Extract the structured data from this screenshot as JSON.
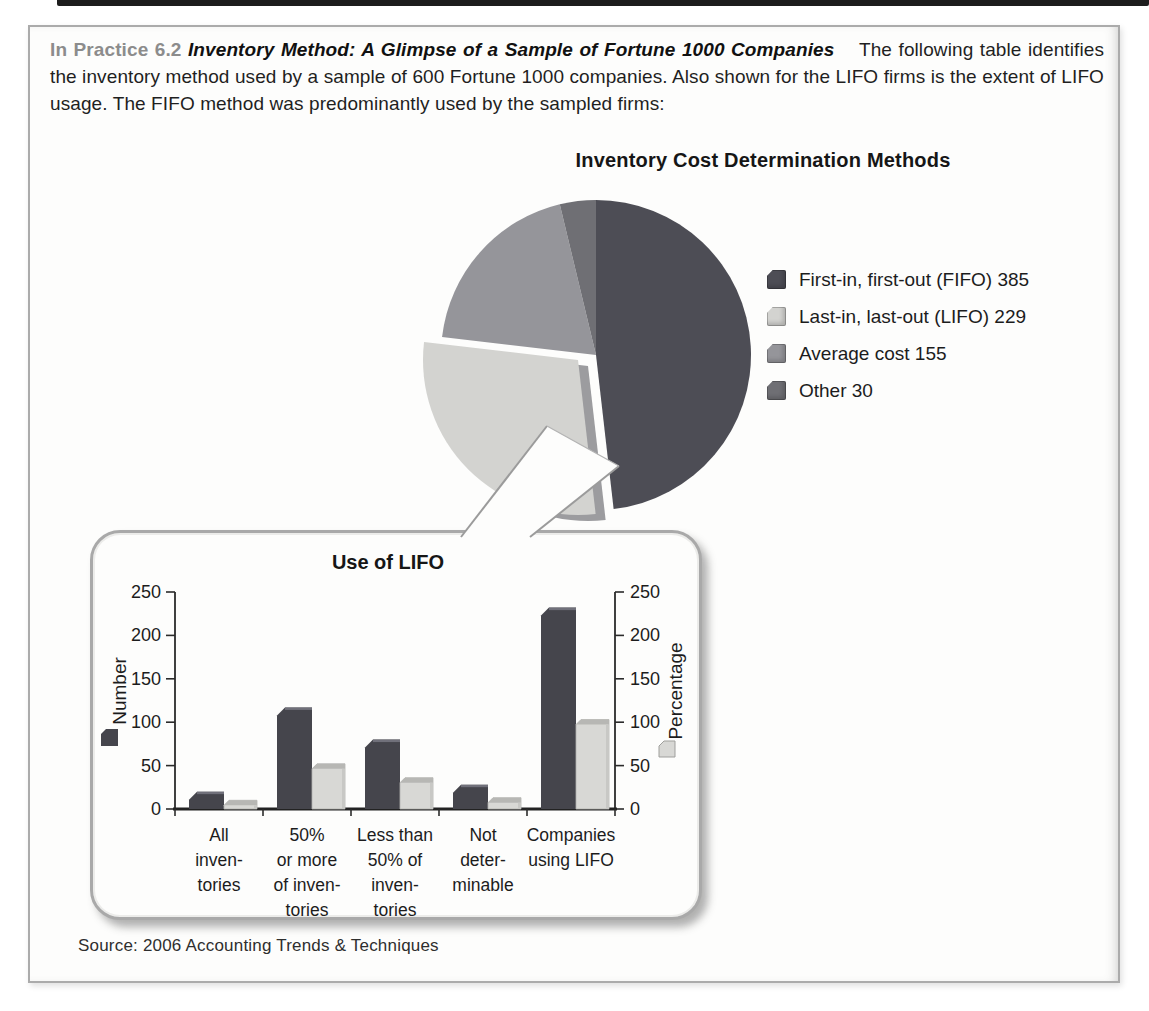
{
  "page": {
    "practice_label": "In Practice 6.2",
    "practice_title": "Inventory Method: A Glimpse of a Sample of Fortune 1000 Companies",
    "intro_text": "The following table identifies the inventory method used by a sample of 600 Fortune 1000 companies. Also shown for the LIFO firms is the extent of LIFO usage. The FIFO method was predominantly used by the sampled firms:",
    "source_text": "Source: 2006 Accounting Trends & Techniques"
  },
  "colors": {
    "fifo": "#4d4d55",
    "lifo": "#d3d3d0",
    "lifo_side": "#9c9c9f",
    "average": "#95959a",
    "other": "#6f6f74",
    "bar_number": "#45454c",
    "bar_number_top": "#70707a",
    "bar_percent": "#d8d8d5",
    "bar_percent_top": "#b7b7b4",
    "bar_percent_side": "#c8c8c5",
    "axis": "#2b2b2b",
    "callout_border": "#9b9b9b",
    "page_bg": "#fdfdfc"
  },
  "chart_data": [
    {
      "type": "pie",
      "title": "Inventory Cost Determination Methods",
      "labels": [
        "First-in, first-out (FIFO)",
        "Last-in, last-out (LIFO)",
        "Average cost",
        "Other"
      ],
      "values": [
        385,
        229,
        155,
        30
      ],
      "legend_labels": [
        "First-in, first-out (FIFO) 385",
        "Last-in, last-out (LIFO) 229",
        "Average cost 155",
        "Other 30"
      ],
      "colors": [
        "#4d4d55",
        "#d3d3d0",
        "#95959a",
        "#6f6f74"
      ],
      "exploded_index": 1,
      "start_angle": "12 o'clock",
      "direction": "clockwise",
      "legend_position": "right"
    },
    {
      "type": "bar",
      "title": "Use of LIFO",
      "categories": [
        "All inventories",
        "50% or more of inventories",
        "Less than 50% of inventories",
        "Not determinable",
        "Companies using LIFO"
      ],
      "category_lines": [
        [
          "All",
          "inven-",
          "tories"
        ],
        [
          "50%",
          "or more",
          "of inven-",
          "tories"
        ],
        [
          "Less than",
          "50% of",
          "inven-",
          "tories"
        ],
        [
          "Not",
          "deter-",
          "minable"
        ],
        [
          "Companies",
          "using LIFO"
        ]
      ],
      "series": [
        {
          "name": "Number",
          "axis": "left",
          "color": "#45454c",
          "values": [
            20,
            117,
            80,
            28,
            232
          ]
        },
        {
          "name": "Percentage",
          "axis": "right",
          "color": "#d8d8d5",
          "values": [
            10,
            52,
            36,
            13,
            103
          ]
        }
      ],
      "ylim": [
        0,
        250
      ],
      "yticks": [
        0,
        50,
        100,
        150,
        200,
        250
      ],
      "ylabel_left": "Number",
      "ylabel_right": "Percentage",
      "grid": false,
      "legend_position": "axis-labels"
    }
  ]
}
